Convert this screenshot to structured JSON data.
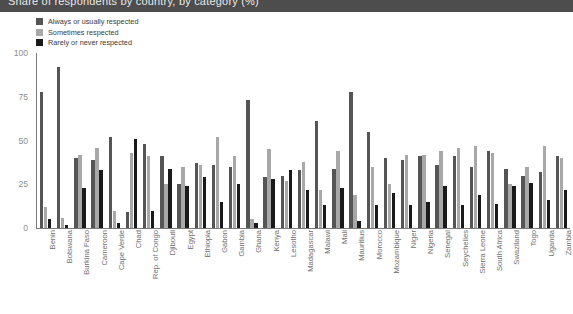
{
  "title": "Share of respondents by country, by category (%)",
  "legend": {
    "items": [
      {
        "label": "Always or usually respected",
        "color": "#555555",
        "key": "always"
      },
      {
        "label": "Sometimes respected",
        "color": "#a8a8a8",
        "key": "sometimes"
      },
      {
        "label": "Rarely or never respected",
        "color": "#1a1a1a",
        "key": "rarely"
      }
    ]
  },
  "axis": {
    "y_ticks": [
      0,
      25,
      50,
      75,
      100
    ],
    "y_min": 0,
    "y_max": 100
  },
  "colors": {
    "title_bar": "#4d4d4d",
    "title_text": "#e9e9e9",
    "axis": "#7a7a7a",
    "tick_text": "#8e8e8e",
    "xlabel_text": "#6f6f6f",
    "series_always": "#555555",
    "series_sometimes": "#a8a8a8",
    "series_rarely": "#1a1a1a",
    "background": "#ffffff"
  },
  "chart_data": {
    "type": "bar",
    "title": "Share of respondents by country, by category (%)",
    "xlabel": "",
    "ylabel": "",
    "ylim": [
      0,
      100
    ],
    "grid": false,
    "legend_position": "top-left",
    "categories": [
      "Benin",
      "Botswana",
      "Burkina Faso",
      "Cameroon",
      "Cape Verde",
      "Chad",
      "Rep. of Congo",
      "Djibouti",
      "Egypt",
      "Ethiopia",
      "Gabon",
      "Gambia",
      "Ghana",
      "Kenya",
      "Lesotho",
      "Madagascar",
      "Malawi",
      "Mali",
      "Mauritius",
      "Morocco",
      "Mozambique",
      "Niger",
      "Nigeria",
      "Senegal",
      "Seychelles",
      "Sierra Leone",
      "South Africa",
      "Swaziland",
      "Togo",
      "Uganda",
      "Zambia"
    ],
    "series": [
      {
        "name": "Always or usually respected",
        "color": "#555555",
        "values": [
          78,
          92,
          40,
          39,
          52,
          9,
          48,
          41,
          25,
          37,
          36,
          35,
          73,
          29,
          30,
          33,
          61,
          34,
          78,
          55,
          40,
          39,
          41,
          36,
          41,
          35,
          44,
          34,
          30,
          32,
          41
        ]
      },
      {
        "name": "Sometimes respected",
        "color": "#a8a8a8",
        "values": [
          12,
          6,
          42,
          46,
          10,
          43,
          41,
          25,
          35,
          36,
          52,
          41,
          5,
          45,
          27,
          38,
          22,
          44,
          19,
          35,
          25,
          42,
          42,
          44,
          46,
          47,
          43,
          25,
          35,
          47,
          40
        ]
      },
      {
        "name": "Rarely or never respected",
        "color": "#1a1a1a",
        "values": [
          5,
          2,
          23,
          33,
          3,
          51,
          10,
          34,
          24,
          29,
          15,
          25,
          3,
          28,
          33,
          22,
          13,
          23,
          4,
          13,
          20,
          13,
          15,
          24,
          13,
          19,
          14,
          24,
          26,
          16,
          22
        ]
      }
    ]
  }
}
